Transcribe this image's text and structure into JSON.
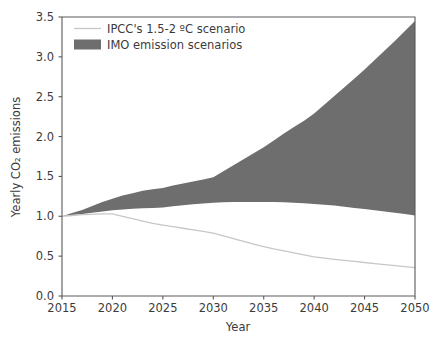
{
  "chart_data": {
    "type": "area",
    "title": "",
    "subtitle": "",
    "xlabel": "Year",
    "ylabel": "Yearly CO₂ emissions",
    "xlim": [
      2015,
      2050
    ],
    "ylim": [
      0.0,
      3.5
    ],
    "grid": false,
    "legend_position": "upper left",
    "x_ticks": [
      "2015",
      "2020",
      "2025",
      "2030",
      "2035",
      "2040",
      "2045",
      "2050"
    ],
    "x_tick_values": [
      2015,
      2020,
      2025,
      2030,
      2035,
      2040,
      2045,
      2050
    ],
    "y_ticks": [
      "0.0",
      "0.5",
      "1.0",
      "1.5",
      "2.0",
      "2.5",
      "3.0",
      "3.5"
    ],
    "y_tick_values": [
      0.0,
      0.5,
      1.0,
      1.5,
      2.0,
      2.5,
      3.0,
      3.5
    ],
    "x": [
      2015,
      2016,
      2017,
      2018,
      2019,
      2020,
      2021,
      2022,
      2023,
      2024,
      2025,
      2026,
      2027,
      2028,
      2029,
      2030,
      2031,
      2032,
      2033,
      2034,
      2035,
      2036,
      2037,
      2038,
      2039,
      2040,
      2041,
      2042,
      2043,
      2044,
      2045,
      2046,
      2047,
      2048,
      2049,
      2050
    ],
    "series": [
      {
        "name": "IPCC's 1.5-2 ºC scenario",
        "type": "line",
        "color": "#c7c7c7",
        "values": [
          1.0,
          1.01,
          1.02,
          1.025,
          1.03,
          1.03,
          1.0,
          0.97,
          0.94,
          0.91,
          0.89,
          0.87,
          0.85,
          0.83,
          0.81,
          0.79,
          0.755,
          0.72,
          0.685,
          0.65,
          0.62,
          0.59,
          0.565,
          0.54,
          0.515,
          0.49,
          0.475,
          0.46,
          0.447,
          0.434,
          0.42,
          0.407,
          0.394,
          0.381,
          0.368,
          0.355
        ]
      },
      {
        "name": "IMO emission scenarios",
        "type": "band",
        "color": "#6e6e6e",
        "upper": [
          1.0,
          1.04,
          1.08,
          1.13,
          1.18,
          1.22,
          1.26,
          1.29,
          1.32,
          1.34,
          1.355,
          1.385,
          1.41,
          1.435,
          1.46,
          1.49,
          1.565,
          1.64,
          1.715,
          1.79,
          1.865,
          1.95,
          2.04,
          2.12,
          2.2,
          2.29,
          2.4,
          2.51,
          2.62,
          2.73,
          2.84,
          2.96,
          3.08,
          3.2,
          3.325,
          3.45
        ],
        "lower": [
          1.0,
          1.015,
          1.03,
          1.045,
          1.06,
          1.075,
          1.085,
          1.095,
          1.1,
          1.105,
          1.11,
          1.125,
          1.14,
          1.15,
          1.16,
          1.17,
          1.175,
          1.178,
          1.18,
          1.18,
          1.18,
          1.178,
          1.175,
          1.17,
          1.163,
          1.155,
          1.145,
          1.135,
          1.12,
          1.105,
          1.09,
          1.075,
          1.06,
          1.045,
          1.028,
          1.01
        ]
      }
    ],
    "legend_entries": [
      {
        "label": "IPCC's 1.5-2 ºC scenario",
        "marker": "line",
        "color": "#c7c7c7"
      },
      {
        "label": "IMO emission scenarios",
        "marker": "patch",
        "color": "#6e6e6e"
      }
    ]
  },
  "colors": {
    "background": "#ffffff",
    "band": "#6e6e6e",
    "line": "#c7c7c7",
    "axis": "#5a5a5a",
    "text": "#3b3b3b"
  }
}
